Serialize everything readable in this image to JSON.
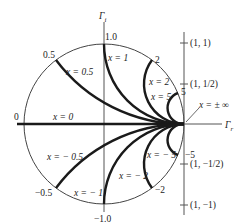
{
  "diagram": {
    "axes": {
      "imag_label": "Γ",
      "imag_sub": "i",
      "real_label": "Γ",
      "real_sub": "r"
    },
    "colors": {
      "ink": "#1a1a1a",
      "axis": "#555555",
      "background": "#ffffff"
    },
    "boundary_labels": {
      "top": "1.0",
      "bottom": "−1.0",
      "left": "0",
      "upper_half": "0.5",
      "lower_half": "−0.5",
      "upper_2": "2",
      "lower_2": "−2",
      "upper_5": "5",
      "lower_5": "−5"
    },
    "arc_labels": {
      "x_pos_05": "x = 0.5",
      "x_pos_1": "x = 1",
      "x_pos_2": "x = 2",
      "x_pos_5": "x = 5",
      "x_zero": "x = 0",
      "x_neg_05": "x = − 0.5",
      "x_neg_1": "x = − 1",
      "x_neg_2": "x = − 2",
      "x_neg_5": "x = − 5",
      "x_inf": "x = ± ∞"
    },
    "right_axis_ticks": [
      {
        "label": "(1, 1)",
        "y": 43
      },
      {
        "label": "(1, 1/2)",
        "y": 84
      },
      {
        "label": "(1, −1/2)",
        "y": 164
      },
      {
        "label": "(1, −1)",
        "y": 205
      }
    ],
    "reactance_values": [
      0.5,
      1,
      2,
      5,
      -0.5,
      -1,
      -2,
      -5,
      0
    ]
  }
}
